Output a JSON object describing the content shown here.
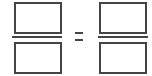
{
  "equation": {
    "left_fraction": {
      "numerator": "",
      "denominator": ""
    },
    "operator": "=",
    "right_fraction": {
      "numerator": "",
      "denominator": ""
    }
  },
  "colors": {
    "stroke": "#444444",
    "background": "#ffffff"
  }
}
